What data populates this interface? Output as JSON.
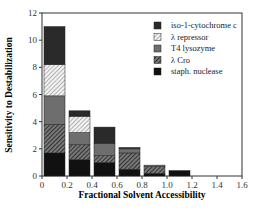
{
  "chart_data": {
    "type": "bar",
    "stacked": true,
    "title": "",
    "xlabel": "Fractional  Solvent  Accessibility",
    "ylabel": "Sensitivity  to  Destabilization",
    "xlim": [
      0,
      1.6
    ],
    "ylim": [
      0,
      12
    ],
    "xticks": [
      "0",
      "0.2",
      "0.4",
      "0.6",
      "0.8",
      "1.0",
      "1.2",
      "1.4",
      "1.6"
    ],
    "yticks": [
      "0",
      "2",
      "4",
      "6",
      "8",
      "10",
      "12"
    ],
    "categories": [
      "0-0.2",
      "0.2-0.4",
      "0.4-0.6",
      "0.6-0.8",
      "0.8-1.0",
      "1.0-1.2"
    ],
    "bin_edges": [
      0,
      0.2,
      0.4,
      0.6,
      0.8,
      1.0,
      1.2
    ],
    "series": [
      {
        "name": "staph. nuclease",
        "values": [
          1.7,
          1.2,
          1.0,
          0.5,
          0.2,
          0.4
        ],
        "color": "#111111",
        "pattern": "solid"
      },
      {
        "name": "λ  Cro",
        "values": [
          2.1,
          1.1,
          0.5,
          1.2,
          0.5,
          0
        ],
        "color": "#444444",
        "pattern": "hatch-dark"
      },
      {
        "name": "T4 lysozyme",
        "values": [
          2.1,
          0.9,
          0.9,
          0.3,
          0.1,
          0
        ],
        "color": "#6e6e6e",
        "pattern": "solid"
      },
      {
        "name": "λ  repressor",
        "values": [
          2.3,
          1.2,
          0,
          0,
          0,
          0
        ],
        "color": "#cfcfcf",
        "pattern": "hatch-light"
      },
      {
        "name": "iso-1-cytochrome c",
        "values": [
          2.8,
          0.4,
          1.2,
          0.1,
          0,
          0
        ],
        "color": "#2a2a2a",
        "pattern": "solid"
      }
    ],
    "legend": {
      "position": "upper right",
      "entries": [
        "iso-1-cytochrome c",
        "λ  repressor",
        "T4 lysozyme",
        "λ  Cro",
        "staph. nuclease"
      ]
    },
    "grid": false
  }
}
